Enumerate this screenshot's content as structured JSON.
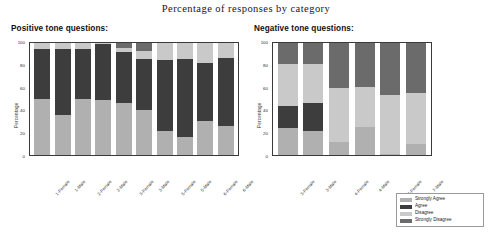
{
  "title": "Percentage of responses by category",
  "panels": {
    "positive": {
      "heading": "Positive tone questions:"
    },
    "negative": {
      "heading": "Negative tone questions:"
    }
  },
  "axis": {
    "ylabel": "Percentage",
    "yticks": [
      "100",
      "80",
      "60",
      "40",
      "20",
      "0"
    ]
  },
  "legend": {
    "items": [
      {
        "label": "Strongly Agree",
        "color": "#b0b0b0"
      },
      {
        "label": "Agree",
        "color": "#3d3d3d"
      },
      {
        "label": "Disagree",
        "color": "#c9c9c9"
      },
      {
        "label": "Strongly Disagree",
        "color": "#6b6b6b"
      }
    ]
  },
  "colors": {
    "strongly_agree": "#b0b0b0",
    "agree": "#3d3d3d",
    "disagree": "#c9c9c9",
    "strongly_disagree": "#6b6b6b",
    "axis": "#3a3a3a",
    "background": "#ffffff"
  },
  "chart_data": [
    {
      "type": "bar",
      "stacked": true,
      "title": "Positive tone questions:",
      "xlabel": "",
      "ylabel": "Percentage",
      "ylim": [
        0,
        100
      ],
      "yticks": [
        0,
        20,
        40,
        60,
        80,
        100
      ],
      "grid": false,
      "legend_position": "outside-bottom-right",
      "categories": [
        "1-Female",
        "1-Male",
        "2-Female",
        "2-Male",
        "3-Female",
        "3-Male",
        "5-Female",
        "5-Male",
        "6-Female",
        "6-Male"
      ],
      "series": [
        {
          "name": "Strongly Agree",
          "values": [
            50,
            36,
            50,
            49,
            46,
            40,
            21,
            16,
            30,
            26
          ]
        },
        {
          "name": "Agree",
          "values": [
            45,
            59,
            45,
            50,
            46,
            46,
            64,
            70,
            52,
            61
          ]
        },
        {
          "name": "Disagree",
          "values": [
            5,
            5,
            5,
            1,
            4,
            7,
            15,
            14,
            18,
            13
          ]
        },
        {
          "name": "Strongly Disagree",
          "values": [
            0,
            0,
            0,
            0,
            4,
            7,
            0,
            0,
            0,
            0
          ]
        }
      ]
    },
    {
      "type": "bar",
      "stacked": true,
      "title": "Negative tone questions:",
      "xlabel": "",
      "ylabel": "Percentage",
      "ylim": [
        0,
        100
      ],
      "yticks": [
        0,
        20,
        40,
        60,
        80,
        100
      ],
      "grid": false,
      "legend_position": "outside-bottom-right",
      "categories": [
        "3-Female",
        "3-Male",
        "4-Female",
        "4-Male",
        "7-Female",
        "7-Male"
      ],
      "series": [
        {
          "name": "Strongly Agree",
          "values": [
            24,
            21,
            12,
            25,
            1,
            10
          ]
        },
        {
          "name": "Agree",
          "values": [
            20,
            25,
            0,
            0,
            0,
            0
          ]
        },
        {
          "name": "Disagree",
          "values": [
            37,
            35,
            48,
            36,
            53,
            45
          ]
        },
        {
          "name": "Strongly Disagree",
          "values": [
            19,
            19,
            40,
            39,
            46,
            45
          ]
        }
      ]
    }
  ]
}
